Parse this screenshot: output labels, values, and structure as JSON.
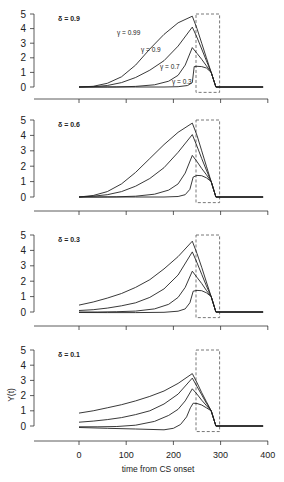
{
  "chart_data": {
    "type": "line",
    "xlabel": "time from CS onset",
    "ylabel": "Y(t)",
    "xlim": [
      -60,
      400
    ],
    "ylim": [
      -0.3,
      5
    ],
    "x_ticks": [
      0,
      100,
      200,
      300,
      400
    ],
    "y_ticks": [
      0,
      1,
      2,
      3,
      4,
      5
    ],
    "grid": false,
    "legend": "inline labels in first panel",
    "us_box": {
      "x_start": 250,
      "x_end": 300,
      "style": "dashed"
    },
    "panels": [
      {
        "label": "δ = 0.9",
        "series": [
          {
            "name": "γ = 0.99",
            "x": [
              0,
              30,
              60,
              90,
              120,
              150,
              180,
              210,
              240,
              250,
              260,
              270,
              280,
              290,
              390
            ],
            "y": [
              0,
              0.05,
              0.25,
              0.7,
              1.5,
              2.6,
              3.6,
              4.4,
              4.85,
              4.0,
              3.0,
              2.0,
              1.0,
              0,
              0
            ]
          },
          {
            "name": "γ = 0.9",
            "x": [
              0,
              30,
              60,
              90,
              120,
              150,
              180,
              210,
              240,
              250,
              260,
              270,
              280,
              290,
              390
            ],
            "y": [
              0,
              0.02,
              0.1,
              0.3,
              0.65,
              1.15,
              1.8,
              2.8,
              4.1,
              3.4,
              2.6,
              1.8,
              1.0,
              0,
              0
            ]
          },
          {
            "name": "γ = 0.7",
            "x": [
              0,
              40,
              80,
              120,
              160,
              190,
              210,
              225,
              240,
              250,
              260,
              270,
              280,
              290,
              390
            ],
            "y": [
              0,
              0,
              0.01,
              0.04,
              0.15,
              0.4,
              0.8,
              1.5,
              2.7,
              2.3,
              1.9,
              1.45,
              1.0,
              0,
              0
            ]
          },
          {
            "name": "γ = 0.3",
            "x": [
              0,
              60,
              120,
              180,
              210,
              230,
              240,
              244,
              250,
              260,
              270,
              280,
              290,
              390
            ],
            "y": [
              0,
              0,
              0,
              0,
              0.02,
              0.1,
              0.3,
              1.4,
              1.42,
              1.4,
              1.3,
              1.0,
              0,
              0
            ]
          }
        ],
        "inline_labels": [
          {
            "text": "γ = 0.99",
            "x": 117,
            "y": 35
          },
          {
            "text": "γ = 0.9",
            "x": 141,
            "y": 52
          },
          {
            "text": "γ = 0.7",
            "x": 160,
            "y": 69
          },
          {
            "text": "γ = 0.3",
            "x": 172,
            "y": 84
          }
        ]
      },
      {
        "label": "δ = 0.6",
        "series": [
          {
            "name": "γ = 0.99",
            "x": [
              0,
              30,
              60,
              90,
              120,
              150,
              180,
              210,
              240,
              250,
              260,
              270,
              280,
              290,
              390
            ],
            "y": [
              0,
              0.1,
              0.35,
              0.85,
              1.6,
              2.5,
              3.4,
              4.2,
              4.8,
              4.0,
              3.0,
              2.0,
              1.0,
              0,
              0
            ]
          },
          {
            "name": "γ = 0.9",
            "x": [
              0,
              30,
              60,
              90,
              120,
              150,
              180,
              210,
              240,
              250,
              260,
              270,
              280,
              290,
              390
            ],
            "y": [
              0,
              0.05,
              0.15,
              0.35,
              0.7,
              1.2,
              1.9,
              2.9,
              4.05,
              3.3,
              2.5,
              1.75,
              1.0,
              0,
              0
            ]
          },
          {
            "name": "γ = 0.7",
            "x": [
              0,
              40,
              80,
              120,
              160,
              190,
              210,
              225,
              240,
              250,
              260,
              270,
              280,
              290,
              390
            ],
            "y": [
              0,
              0,
              0.01,
              0.05,
              0.18,
              0.45,
              0.85,
              1.55,
              2.7,
              2.3,
              1.85,
              1.45,
              1.0,
              0,
              0
            ]
          },
          {
            "name": "γ = 0.3",
            "x": [
              0,
              60,
              120,
              180,
              210,
              225,
              235,
              242,
              250,
              260,
              270,
              280,
              290,
              390
            ],
            "y": [
              0,
              0,
              0,
              0,
              0.03,
              0.15,
              0.5,
              1.3,
              1.4,
              1.38,
              1.25,
              1.0,
              0,
              0
            ]
          }
        ]
      },
      {
        "label": "δ = 0.3",
        "series": [
          {
            "name": "γ = 0.99",
            "x": [
              0,
              30,
              60,
              90,
              120,
              150,
              180,
              210,
              240,
              250,
              260,
              270,
              280,
              290,
              390
            ],
            "y": [
              0.45,
              0.65,
              0.9,
              1.2,
              1.6,
              2.1,
              2.8,
              3.6,
              4.6,
              3.8,
              2.9,
              1.95,
              1.0,
              0,
              0
            ]
          },
          {
            "name": "γ = 0.9",
            "x": [
              0,
              30,
              60,
              90,
              120,
              150,
              180,
              210,
              240,
              250,
              260,
              270,
              280,
              290,
              390
            ],
            "y": [
              0.1,
              0.15,
              0.25,
              0.4,
              0.6,
              0.95,
              1.5,
              2.4,
              3.9,
              3.2,
              2.45,
              1.7,
              1.0,
              0,
              0
            ]
          },
          {
            "name": "γ = 0.7",
            "x": [
              0,
              40,
              80,
              120,
              160,
              190,
              210,
              225,
              240,
              250,
              260,
              270,
              280,
              290,
              390
            ],
            "y": [
              0,
              0,
              0.02,
              0.06,
              0.2,
              0.5,
              0.95,
              1.6,
              2.65,
              2.25,
              1.85,
              1.4,
              1.0,
              0,
              0
            ]
          },
          {
            "name": "γ = 0.3",
            "x": [
              0,
              60,
              120,
              180,
              210,
              225,
              235,
              242,
              250,
              260,
              270,
              280,
              290,
              390
            ],
            "y": [
              -0.03,
              -0.04,
              -0.04,
              -0.02,
              0.05,
              0.2,
              0.6,
              1.35,
              1.4,
              1.38,
              1.25,
              1.0,
              0,
              0
            ]
          }
        ]
      },
      {
        "label": "δ = 0.1",
        "series": [
          {
            "name": "γ = 0.99",
            "x": [
              0,
              30,
              60,
              90,
              120,
              150,
              180,
              210,
              240,
              250,
              260,
              270,
              280,
              290,
              390
            ],
            "y": [
              0.85,
              1.0,
              1.2,
              1.4,
              1.65,
              1.95,
              2.3,
              2.8,
              3.45,
              2.85,
              2.2,
              1.6,
              1.0,
              0,
              0
            ]
          },
          {
            "name": "γ = 0.9",
            "x": [
              0,
              30,
              60,
              90,
              120,
              150,
              180,
              210,
              240,
              250,
              260,
              270,
              280,
              290,
              390
            ],
            "y": [
              0.25,
              0.32,
              0.42,
              0.55,
              0.75,
              1.0,
              1.45,
              2.1,
              3.15,
              2.6,
              2.05,
              1.5,
              1.0,
              0,
              0
            ]
          },
          {
            "name": "γ = 0.7",
            "x": [
              0,
              40,
              80,
              120,
              160,
              190,
              210,
              225,
              240,
              250,
              260,
              270,
              280,
              290,
              390
            ],
            "y": [
              -0.05,
              -0.05,
              -0.03,
              0.05,
              0.3,
              0.7,
              1.1,
              1.65,
              2.45,
              2.1,
              1.7,
              1.35,
              1.0,
              0,
              0
            ]
          },
          {
            "name": "γ = 0.3",
            "x": [
              0,
              60,
              120,
              180,
              200,
              215,
              228,
              236,
              242,
              250,
              260,
              270,
              280,
              290,
              390
            ],
            "y": [
              -0.1,
              -0.15,
              -0.2,
              -0.25,
              -0.15,
              0.1,
              0.6,
              1.2,
              1.5,
              1.48,
              1.38,
              1.2,
              1.0,
              0,
              0
            ]
          }
        ]
      }
    ]
  }
}
